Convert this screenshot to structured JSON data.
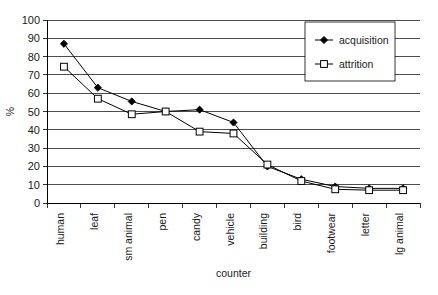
{
  "chart_data": {
    "type": "line",
    "title": "",
    "xlabel": "counter",
    "ylabel": "%",
    "ylim": [
      0,
      100
    ],
    "ytick_step": 10,
    "yticks": [
      "0",
      "10",
      "20",
      "30",
      "40",
      "50",
      "60",
      "70",
      "80",
      "90",
      "100"
    ],
    "grid": true,
    "legend_position": "top-right",
    "categories": [
      "human",
      "leaf",
      "sm animal",
      "pen",
      "candy",
      "vehicle",
      "building",
      "bird",
      "footwear",
      "letter",
      "lg animal"
    ],
    "series": [
      {
        "name": "acquisition",
        "marker": "filled-diamond",
        "values": [
          87,
          63,
          55.5,
          50,
          51,
          44,
          20,
          13,
          9,
          8,
          8
        ]
      },
      {
        "name": "attrition",
        "marker": "open-square",
        "values": [
          74.5,
          57,
          48.5,
          50,
          39,
          38,
          21,
          12,
          7.5,
          7,
          7
        ]
      }
    ]
  },
  "legend": {
    "entries": [
      {
        "label": "acquisition"
      },
      {
        "label": "attrition"
      }
    ]
  },
  "colors": {
    "line": "#000000",
    "grid": "#000000",
    "background": "#ffffff",
    "text": "#1a1a1a"
  }
}
